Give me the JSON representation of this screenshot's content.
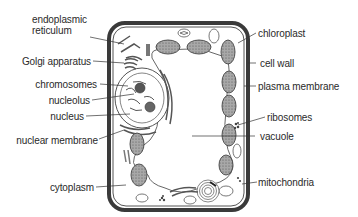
{
  "colors": {
    "cell_wall": "#3a3a3a",
    "outline": "#4a4a4a",
    "organelle_fill": "#9a9a9a",
    "text": "#2a2a2a",
    "background": "#ffffff"
  },
  "labels_left": [
    {
      "id": "endoplasmic-reticulum",
      "line1": "endoplasmic",
      "line2": "reticulum"
    },
    {
      "id": "golgi-apparatus",
      "text": "Golgi apparatus"
    },
    {
      "id": "chromosomes",
      "text": "chromosomes"
    },
    {
      "id": "nucleolus",
      "text": "nucleolus"
    },
    {
      "id": "nucleus",
      "text": "nucleus"
    },
    {
      "id": "nuclear-membrane",
      "text": "nuclear membrane"
    },
    {
      "id": "cytoplasm",
      "text": "cytoplasm"
    }
  ],
  "labels_right": [
    {
      "id": "chloroplast",
      "text": "chloroplast"
    },
    {
      "id": "cell-wall",
      "text": "cell wall"
    },
    {
      "id": "plasma-membrane",
      "text": "plasma membrane"
    },
    {
      "id": "ribosomes",
      "text": "ribosomes"
    },
    {
      "id": "vacuole",
      "text": "vacuole"
    },
    {
      "id": "mitochondria",
      "text": "mitochondria"
    }
  ]
}
